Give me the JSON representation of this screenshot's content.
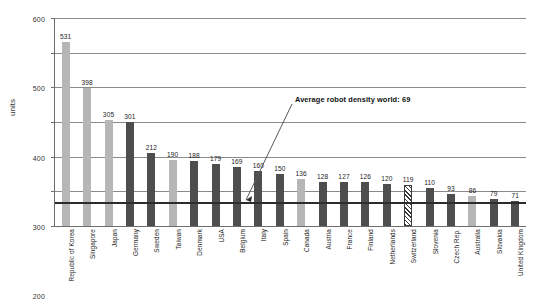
{
  "chart_data": {
    "type": "bar",
    "title": "",
    "subtitle": "",
    "xlabel": "",
    "ylabel": "units",
    "ylim": [
      0,
      600
    ],
    "yticks": [
      0,
      100,
      200,
      300,
      400,
      500,
      600
    ],
    "ytick_labels": [
      "0",
      "100",
      "200",
      "300",
      "400",
      "500",
      "600"
    ],
    "grid": true,
    "legend": null,
    "categories": [
      "Republic of Korea",
      "Singapore",
      "Japan",
      "Germany",
      "Sweden",
      "Taiwan",
      "Denmark",
      "USA",
      "Belgium",
      "Italy",
      "Spain",
      "Canada",
      "Austria",
      "France",
      "Finland",
      "Netherlands",
      "Switzerland",
      "Slovenia",
      "Czech Rep.",
      "Australia",
      "Slovakia",
      "United Kingdom"
    ],
    "values": [
      531,
      398,
      305,
      301,
      212,
      190,
      188,
      179,
      169,
      160,
      150,
      136,
      128,
      127,
      126,
      120,
      119,
      110,
      93,
      86,
      79,
      71
    ],
    "bar_styles": [
      "light",
      "light",
      "light",
      "dark",
      "dark",
      "light",
      "dark",
      "dark",
      "dark",
      "dark",
      "dark",
      "light",
      "dark",
      "dark",
      "dark",
      "dark",
      "hatch",
      "dark",
      "dark",
      "light",
      "dark",
      "dark"
    ],
    "annotations": [
      {
        "text": "Average robot density world: 69",
        "value": 69,
        "type": "reference-line"
      }
    ]
  },
  "colors": {
    "bar_light": "#b6b6b6",
    "bar_dark": "#4e4e4e",
    "hatch": "#3a3a3a",
    "gridline": "#8a8a8a",
    "axis": "#6d6d6d",
    "average_line": "#2c2c2c",
    "text": "#1d1d1d",
    "background": "#ffffff"
  }
}
